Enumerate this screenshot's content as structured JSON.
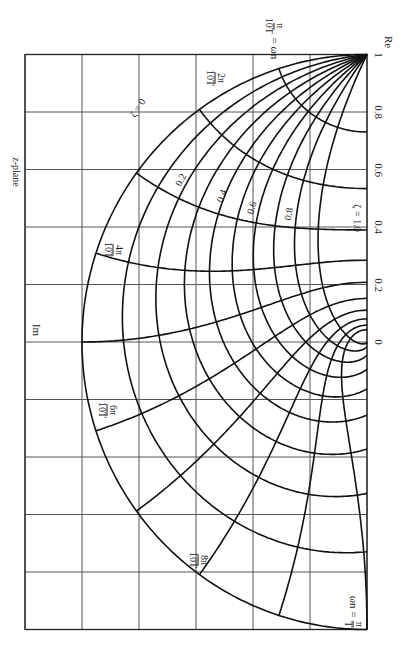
{
  "title": "z-plane",
  "axes": {
    "re_label": "Re",
    "im_label": "Im",
    "re_ticks": [
      {
        "value": 1,
        "label": "1"
      },
      {
        "value": 0.8,
        "label": "0.8"
      },
      {
        "value": 0.6,
        "label": "0.6"
      },
      {
        "value": 0.4,
        "label": "0.4"
      },
      {
        "value": 0.2,
        "label": "0.2"
      },
      {
        "value": 0,
        "label": "0"
      }
    ],
    "re_range": [
      -1,
      1
    ],
    "im_range": [
      0,
      1.2
    ],
    "grid_step": 0.2
  },
  "zeta_labels": [
    {
      "value": 0,
      "label": "ζ = 0"
    },
    {
      "value": 0.2,
      "label": "0.2"
    },
    {
      "value": 0.4,
      "label": "0.4"
    },
    {
      "value": 0.6,
      "label": "0.6"
    },
    {
      "value": 0.8,
      "label": "0.8"
    },
    {
      "value": 1.0,
      "label": "ζ = 1.0"
    }
  ],
  "wn_labels": [
    {
      "num": "π",
      "den": "10T",
      "suffix": "= ωn"
    },
    {
      "num": "2π",
      "den": "10T"
    },
    {
      "num": "4π",
      "den": "10T"
    },
    {
      "num": "6π",
      "den": "10T"
    },
    {
      "num": "8π",
      "den": "10T"
    },
    {
      "prefix": "ωn =",
      "num": "π",
      "den": "T"
    }
  ],
  "chart_data": {
    "type": "diagram",
    "title": "z-plane",
    "zeta_values": [
      0,
      0.1,
      0.2,
      0.3,
      0.4,
      0.5,
      0.6,
      0.7,
      0.8,
      0.9
    ],
    "wn_T_values_over_pi": [
      0.1,
      0.2,
      0.3,
      0.4,
      0.5,
      0.6,
      0.7,
      0.8,
      0.9,
      1.0
    ],
    "xlabel": "Re",
    "ylabel": "Im",
    "xlim": [
      -1,
      1
    ],
    "ylim": [
      0,
      1.2
    ],
    "grid": true
  }
}
